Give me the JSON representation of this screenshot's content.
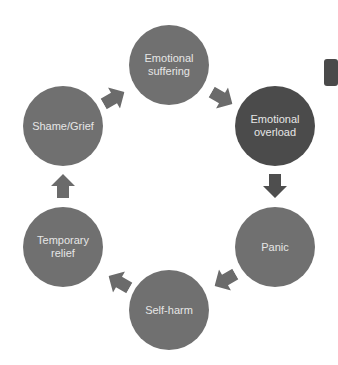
{
  "diagram": {
    "type": "cycle",
    "colors": {
      "node": "#707070",
      "node_highlight": "#4b4b4b",
      "arrow": "#6b6b6b",
      "arrow_highlight": "#4e4e4e",
      "text": "#e6e6e6",
      "edge_tab": "#4a4a4a"
    },
    "nodes": [
      {
        "id": "emotional-suffering",
        "line1": "Emotional",
        "line2": "suffering"
      },
      {
        "id": "emotional-overload",
        "line1": "Emotional",
        "line2": "overload"
      },
      {
        "id": "panic",
        "line1": "Panic",
        "line2": ""
      },
      {
        "id": "self-harm",
        "line1": "Self-harm",
        "line2": ""
      },
      {
        "id": "temporary-relief",
        "line1": "Temporary",
        "line2": "relief"
      },
      {
        "id": "shame-grief",
        "line1": "Shame/Grief",
        "line2": ""
      }
    ],
    "edges": [
      {
        "from": "emotional-suffering",
        "to": "emotional-overload"
      },
      {
        "from": "emotional-overload",
        "to": "panic"
      },
      {
        "from": "panic",
        "to": "self-harm"
      },
      {
        "from": "self-harm",
        "to": "temporary-relief"
      },
      {
        "from": "temporary-relief",
        "to": "shame-grief"
      },
      {
        "from": "shame-grief",
        "to": "emotional-suffering"
      }
    ]
  }
}
